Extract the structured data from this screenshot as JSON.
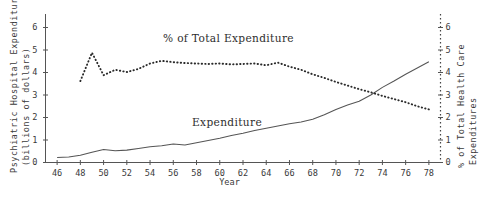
{
  "chart_data": {
    "type": "line",
    "title": "",
    "xlabel": "Year",
    "x_tick_labels": [
      "46",
      "48",
      "50",
      "52",
      "54",
      "56",
      "58",
      "60",
      "62",
      "64",
      "66",
      "68",
      "70",
      "72",
      "74",
      "76",
      "78"
    ],
    "xlim": [
      45,
      79
    ],
    "grid": false,
    "legend_position": "inline-annotations",
    "axes": {
      "left": {
        "label_line1": "Psychiatric Hospital Expenditures",
        "label_line2": "(billions of dollars)",
        "ticks": [
          "0",
          "1",
          "2",
          "3",
          "4",
          "5",
          "6"
        ],
        "lim": [
          0,
          6.6
        ]
      },
      "right": {
        "label_line1": "% of Total Health Care",
        "label_line2": "Expenditures",
        "ticks": [
          "0",
          "1",
          "2",
          "3",
          "4",
          "5",
          "6"
        ],
        "lim": [
          0,
          6.6
        ]
      }
    },
    "annotations": [
      {
        "name": "pct-series-label",
        "text": "% of Total Expenditure"
      },
      {
        "name": "expenditure-series-label",
        "text": "Expenditure"
      }
    ],
    "series": [
      {
        "name": "Expenditure",
        "style": "solid",
        "axis": "left",
        "units": "billions of dollars",
        "x": [
          46,
          47,
          48,
          49,
          50,
          51,
          52,
          53,
          54,
          55,
          56,
          57,
          58,
          59,
          60,
          61,
          62,
          63,
          64,
          65,
          66,
          67,
          68,
          69,
          70,
          71,
          72,
          73,
          74,
          75,
          76,
          77,
          78
        ],
        "values": [
          0.22,
          0.24,
          0.32,
          0.46,
          0.58,
          0.52,
          0.55,
          0.62,
          0.7,
          0.74,
          0.82,
          0.78,
          0.88,
          0.98,
          1.08,
          1.2,
          1.3,
          1.42,
          1.52,
          1.62,
          1.72,
          1.8,
          1.92,
          2.12,
          2.36,
          2.56,
          2.72,
          3.0,
          3.34,
          3.62,
          3.92,
          4.2,
          4.48
        ]
      },
      {
        "name": "% of Total Expenditure",
        "style": "dotted",
        "axis": "right",
        "units": "percent",
        "x": [
          48,
          49,
          50,
          51,
          52,
          53,
          54,
          55,
          56,
          57,
          58,
          59,
          60,
          61,
          62,
          63,
          64,
          65,
          66,
          67,
          68,
          69,
          70,
          71,
          72,
          73,
          74,
          75,
          76,
          77,
          78
        ],
        "values": [
          3.62,
          4.88,
          3.88,
          4.12,
          4.02,
          4.16,
          4.4,
          4.52,
          4.46,
          4.42,
          4.4,
          4.38,
          4.4,
          4.36,
          4.38,
          4.4,
          4.32,
          4.44,
          4.26,
          4.12,
          3.92,
          3.76,
          3.58,
          3.42,
          3.26,
          3.12,
          2.96,
          2.82,
          2.68,
          2.5,
          2.36
        ]
      }
    ]
  }
}
